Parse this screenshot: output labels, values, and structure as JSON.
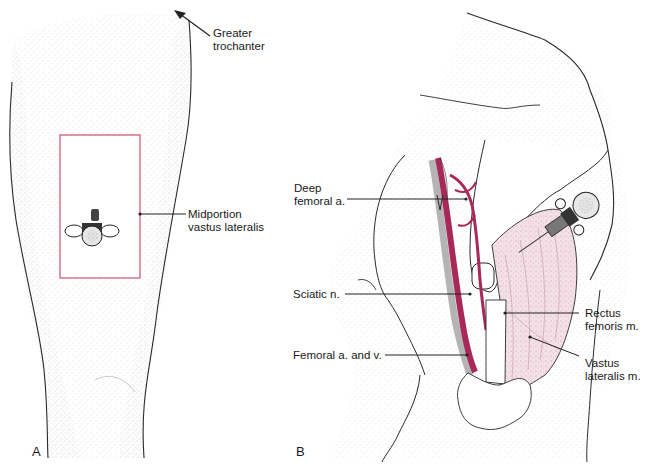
{
  "figure": {
    "colors": {
      "outline": "#2a2a2a",
      "stipple": "#9a9a9a",
      "injection_site_box": "#c8506e",
      "artery": "#a8285a",
      "nerve_vein_gray": "#b4b4b4",
      "muscle_pink": "#e8c6d0"
    },
    "panel_a": {
      "letter": "A",
      "labels": {
        "greater_trochanter": {
          "line1": "Greater",
          "line2": "trochanter"
        },
        "midportion_vastus_lateralis": {
          "line1": "Midportion",
          "line2": "vastus lateralis"
        }
      },
      "icons": [
        "arrow-up-left-icon",
        "syringe-icon",
        "injection-site-rectangle"
      ]
    },
    "panel_b": {
      "letter": "B",
      "labels": {
        "deep_femoral_a": {
          "line1": "Deep",
          "line2": "femoral a."
        },
        "sciatic_n": {
          "line1": "Sciatic n."
        },
        "femoral_a_and_v": {
          "line1": "Femoral a. and v."
        },
        "rectus_femoris_m": {
          "line1": "Rectus",
          "line2": "femoris m."
        },
        "vastus_lateralis_m": {
          "line1": "Vastus",
          "line2": "lateralis m."
        }
      },
      "icons": [
        "syringe-icon",
        "hand-icon",
        "femur-bone",
        "artery-vessel",
        "nerve-band"
      ]
    }
  }
}
